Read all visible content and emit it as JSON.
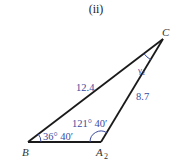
{
  "figure": {
    "title": "(ii)",
    "vertices": {
      "B": {
        "label": "B"
      },
      "A": {
        "label": "A",
        "subscript": "2"
      },
      "C": {
        "label": "C"
      }
    },
    "sides": {
      "BC": "12.4",
      "A2C": "8.7"
    },
    "angles": {
      "B": "36° 40′",
      "A2": "121° 40′",
      "C": "γ₂"
    },
    "colors": {
      "lines": "#1a1a1a",
      "measurements": "#3a4aa0",
      "vertex_labels": "#333333"
    }
  }
}
